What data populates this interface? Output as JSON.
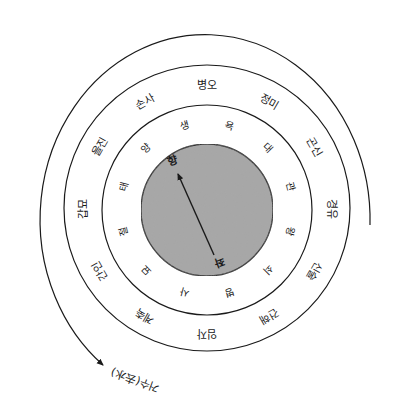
{
  "diagram": {
    "title_caption": "거수(去水)",
    "colors": {
      "line": "#1a1a1a",
      "core_fill": "#a9a9a9",
      "background": "#ffffff"
    },
    "outer_ring_labels": [
      {
        "text": "병오",
        "angle": 0
      },
      {
        "text": "정미",
        "angle": 30
      },
      {
        "text": "곤신",
        "angle": 60
      },
      {
        "text": "경유",
        "angle": 90
      },
      {
        "text": "신술",
        "angle": 120
      },
      {
        "text": "건해",
        "angle": 150
      },
      {
        "text": "임자",
        "angle": 180
      },
      {
        "text": "계축",
        "angle": 210
      },
      {
        "text": "간인",
        "angle": 240
      },
      {
        "text": "갑묘",
        "angle": 270
      },
      {
        "text": "을진",
        "angle": 300
      },
      {
        "text": "손사",
        "angle": 330
      }
    ],
    "stage_labels": [
      {
        "text": "욕",
        "angle": 15
      },
      {
        "text": "대",
        "angle": 45
      },
      {
        "text": "관",
        "angle": 75
      },
      {
        "text": "왕",
        "angle": 105
      },
      {
        "text": "쇠",
        "angle": 135
      },
      {
        "text": "병",
        "angle": 165
      },
      {
        "text": "사",
        "angle": 195
      },
      {
        "text": "묘",
        "angle": 225
      },
      {
        "text": "절",
        "angle": 255
      },
      {
        "text": "태",
        "angle": 285
      },
      {
        "text": "양",
        "angle": 315
      },
      {
        "text": "생",
        "angle": 345
      }
    ],
    "core": {
      "arrow_head_label": "향",
      "arrow_tail_label": "좌"
    }
  }
}
